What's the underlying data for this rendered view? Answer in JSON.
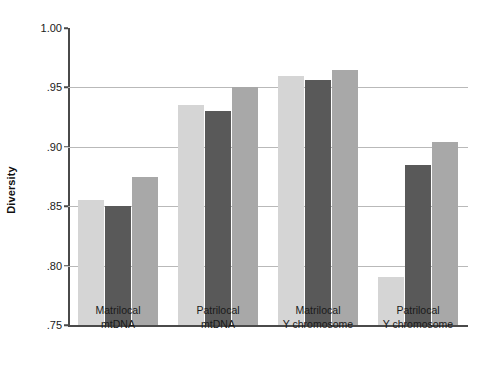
{
  "chart_data": {
    "type": "bar",
    "title": "",
    "xlabel": "",
    "ylabel": "Diversity",
    "ylim": [
      0.75,
      1.0
    ],
    "grid": true,
    "legend": "none",
    "ytick_labels": [
      "1.00",
      ".95",
      ".90",
      ".85",
      ".80",
      ".75"
    ],
    "ytick_values": [
      1.0,
      0.95,
      0.9,
      0.85,
      0.8,
      0.75
    ],
    "categories": [
      "Matrilocal mtDNA",
      "Patrilocal mtDNA",
      "Matrilocal Y chromosome",
      "Patrilocal Y chromosome"
    ],
    "category_lines": [
      [
        "Matrilocal",
        "mtDNA"
      ],
      [
        "Patrilocal",
        "mtDNA"
      ],
      [
        "Matrilocal",
        "Y chromosome"
      ],
      [
        "Patrilocal",
        "Y chromosome"
      ]
    ],
    "series": [
      {
        "name": "series-1",
        "color": "#d5d5d5",
        "values": [
          0.855,
          0.935,
          0.96,
          0.79
        ]
      },
      {
        "name": "series-2",
        "color": "#595959",
        "values": [
          0.85,
          0.93,
          0.956,
          0.885
        ]
      },
      {
        "name": "series-3",
        "color": "#a8a8a8",
        "values": [
          0.875,
          0.95,
          0.965,
          0.904
        ]
      }
    ]
  },
  "axis": {
    "y_title": "Diversity"
  }
}
